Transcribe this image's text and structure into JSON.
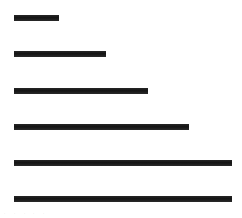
{
  "chart_data": {
    "type": "bar",
    "orientation": "horizontal",
    "title": "",
    "subtitle": "",
    "xlabel": "",
    "ylabel": "",
    "categories": [
      "1",
      "2",
      "3",
      "4",
      "5",
      "6"
    ],
    "values": [
      45,
      92,
      134,
      175,
      218,
      218
    ],
    "xlim": [
      0,
      218
    ],
    "grid": false,
    "legend": null,
    "legend_position": "none",
    "tick_labels_x": [
      "",
      "",
      "",
      "",
      ""
    ],
    "tick_labels_y": [
      "",
      "",
      "",
      "",
      "",
      ""
    ],
    "annotations": [],
    "bar_color": "#1c1c1c",
    "background_color": "#ffffff",
    "bars": [
      {
        "index": "1",
        "value": 45,
        "x": 14,
        "y": 15,
        "width": 45,
        "height": 6
      },
      {
        "index": "2",
        "value": 92,
        "x": 14,
        "y": 51,
        "width": 92,
        "height": 6
      },
      {
        "index": "3",
        "value": 134,
        "x": 14,
        "y": 88,
        "width": 134,
        "height": 6
      },
      {
        "index": "4",
        "value": 175,
        "x": 14,
        "y": 124,
        "width": 175,
        "height": 6
      },
      {
        "index": "5",
        "value": 218,
        "x": 14,
        "y": 160,
        "width": 218,
        "height": 6
      },
      {
        "index": "6",
        "value": 218,
        "x": 14,
        "y": 196,
        "width": 218,
        "height": 6
      }
    ],
    "footer_ticks": [
      {
        "label": "·",
        "x": 4
      },
      {
        "label": "·",
        "x": 14
      },
      {
        "label": "·",
        "x": 24
      },
      {
        "label": "·",
        "x": 33
      },
      {
        "label": "·",
        "x": 43
      }
    ]
  }
}
